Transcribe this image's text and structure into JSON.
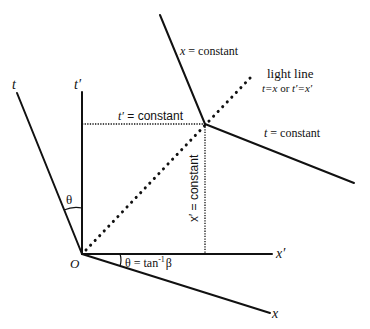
{
  "diagram": {
    "type": "spacetime-diagram",
    "origin_label": "O",
    "axes": {
      "t": "t",
      "t_prime": "t′",
      "x": "x",
      "x_prime": "x′"
    },
    "lines": {
      "x_constant": "x = constant",
      "t_constant": "t = constant",
      "t_prime_constant_var": "t′",
      "t_prime_constant_rest": " = constant",
      "x_prime_constant": "x′ = constant"
    },
    "light_line": {
      "title": "light line",
      "eq1": "t=x",
      "or": " or ",
      "eq2": "t′=x′"
    },
    "angles": {
      "theta": "θ",
      "theta_eq_prefix": "θ = tan",
      "theta_eq_sup": "-1",
      "theta_eq_suffix": "β"
    },
    "colors": {
      "ink": "#111111",
      "background": "#ffffff"
    }
  }
}
